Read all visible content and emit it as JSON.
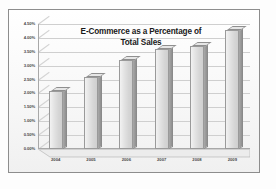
{
  "chart_data": {
    "type": "bar",
    "title": "E-Commerce as a Percentage of Total Sales",
    "title_lines": [
      "E-Commerce as a Percentage of",
      "Total Sales"
    ],
    "categories": [
      "2004",
      "2005",
      "2006",
      "2007",
      "2008",
      "2009"
    ],
    "values": [
      2.1,
      2.6,
      3.2,
      3.6,
      3.7,
      4.3
    ],
    "xlabel": "",
    "ylabel": "",
    "ylim": [
      0.0,
      4.5
    ],
    "ytick_step": 0.5,
    "ytick_labels": [
      "4.50%",
      "4.00%",
      "3.50%",
      "3.00%",
      "2.50%",
      "2.00%",
      "1.50%",
      "1.00%",
      "0.50%",
      "0.00%"
    ],
    "ytick_values": [
      4.5,
      4.0,
      3.5,
      3.0,
      2.5,
      2.0,
      1.5,
      1.0,
      0.5,
      0.0
    ],
    "grid": true,
    "legend": false,
    "legend_position": "none",
    "style": "3d-column",
    "colors": {
      "bar_face": "#e3e3e3",
      "bar_side": "#9a9a9a",
      "bar_outline": "#9a9a9a",
      "gridline": "#cfcfcf",
      "axis": "#a8a8a8",
      "plot_background": "#fbfbfb",
      "frame_border": "#8d8d8d",
      "text": "#1a1a1a",
      "tick_text": "#4a4a4a"
    }
  }
}
